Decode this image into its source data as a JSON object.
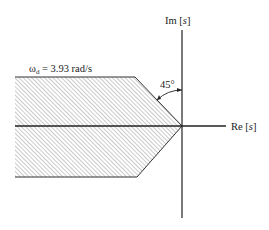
{
  "diagram": {
    "type": "s-plane region",
    "axes": {
      "imag_label_prefix": "Im [",
      "imag_label_var": "s",
      "imag_label_suffix": "]",
      "real_label_prefix": "Re [",
      "real_label_var": "s",
      "real_label_suffix": "]"
    },
    "region": {
      "omega_symbol": "ω",
      "omega_subscript": "d",
      "omega_value": " = 3.93 rad/s",
      "angle_label": "45°",
      "fill": "hatched"
    },
    "colors": {
      "axis": "#222222",
      "hatch": "#8a8a8a",
      "boundary": "#333333"
    }
  }
}
